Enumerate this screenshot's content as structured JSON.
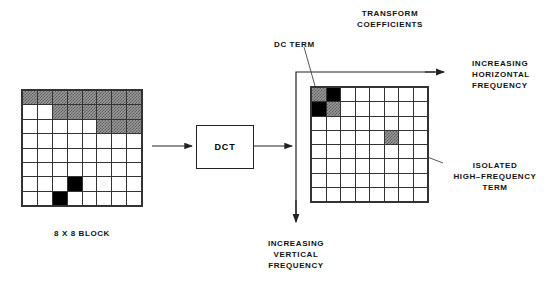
{
  "diagram": {
    "title_labels": {
      "transform_coefficients_line1": "TRANSFORM",
      "transform_coefficients_line2": "COEFFICIENTS",
      "dc_term": "DC TERM",
      "increasing_horizontal_line1": "INCREASING",
      "increasing_horizontal_line2": "HORIZONTAL",
      "increasing_horizontal_line3": "FREQUENCY",
      "isolated_hf_line1": "ISOLATED",
      "isolated_hf_line2": "HIGH–FREQUENCY",
      "isolated_hf_line3": "TERM",
      "increasing_vertical_line1": "INCREASING",
      "increasing_vertical_line2": "VERTICAL",
      "increasing_vertical_line3": "FREQUENCY",
      "block_caption": "8 X 8 BLOCK"
    },
    "process_box": {
      "label": "DCT"
    },
    "colors": {
      "line": "#222222",
      "grid_line": "#333333",
      "shaded_cell": "#8a8a8a",
      "black_cell": "#000000",
      "background": "#ffffff"
    },
    "spatial_block": {
      "rows": 8,
      "cols": 8,
      "cells": [
        [
          "shade",
          "shade",
          "shade",
          "shade",
          "shade",
          "shade",
          "shade",
          "shade"
        ],
        [
          "white",
          "white",
          "shade",
          "shade",
          "shade",
          "shade",
          "shade",
          "shade"
        ],
        [
          "white",
          "white",
          "white",
          "white",
          "white",
          "shade",
          "shade",
          "shade"
        ],
        [
          "white",
          "white",
          "white",
          "white",
          "white",
          "white",
          "white",
          "white"
        ],
        [
          "white",
          "white",
          "white",
          "white",
          "white",
          "white",
          "white",
          "white"
        ],
        [
          "white",
          "white",
          "white",
          "white",
          "white",
          "white",
          "white",
          "white"
        ],
        [
          "white",
          "white",
          "white",
          "black",
          "white",
          "white",
          "white",
          "white"
        ],
        [
          "white",
          "white",
          "black",
          "white",
          "white",
          "white",
          "white",
          "white"
        ]
      ]
    },
    "coefficient_block": {
      "rows": 8,
      "cols": 8,
      "cells": [
        [
          "shade",
          "black",
          "white",
          "white",
          "white",
          "white",
          "white",
          "white"
        ],
        [
          "black",
          "shade",
          "white",
          "white",
          "white",
          "white",
          "white",
          "white"
        ],
        [
          "white",
          "white",
          "white",
          "white",
          "white",
          "white",
          "white",
          "white"
        ],
        [
          "white",
          "white",
          "white",
          "white",
          "white",
          "shade",
          "white",
          "white"
        ],
        [
          "white",
          "white",
          "white",
          "white",
          "white",
          "white",
          "white",
          "white"
        ],
        [
          "white",
          "white",
          "white",
          "white",
          "white",
          "white",
          "white",
          "white"
        ],
        [
          "white",
          "white",
          "white",
          "white",
          "white",
          "white",
          "white",
          "white"
        ],
        [
          "white",
          "white",
          "white",
          "white",
          "white",
          "white",
          "white",
          "white"
        ]
      ]
    }
  }
}
